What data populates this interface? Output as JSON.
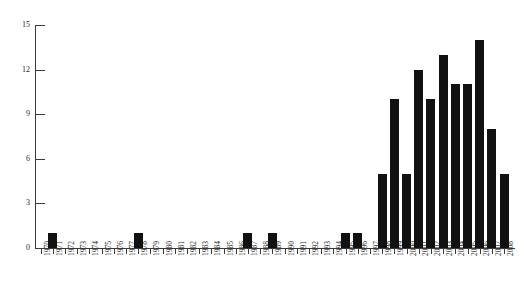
{
  "chart_data": {
    "type": "bar",
    "title": "",
    "subtitle": "",
    "xlabel": "",
    "ylabel": "",
    "grid": false,
    "legend": false,
    "legend_position": "none",
    "bar_color": "#111111",
    "axis_color": "#3a3a3a",
    "background_color": "#ffffff",
    "xlim_categories": [
      "1970",
      "2008"
    ],
    "ylim": [
      0,
      15
    ],
    "y_ticks": [
      0,
      3,
      6,
      9,
      12,
      15
    ],
    "y_tick_labels": [
      "0",
      "3",
      "6",
      "9",
      "12",
      "15"
    ],
    "categories": [
      "1970",
      "1971",
      "1972",
      "1973",
      "1974",
      "1975",
      "1976",
      "1977",
      "1978",
      "1979",
      "1980",
      "1981",
      "1982",
      "1983",
      "1984",
      "1985",
      "1986",
      "1987",
      "1988",
      "1989",
      "1990",
      "1991",
      "1992",
      "1993",
      "1994",
      "1995",
      "1996",
      "1997",
      "1998",
      "1999",
      "2000",
      "2001",
      "2002",
      "2003",
      "2004",
      "2005",
      "2006",
      "2007",
      "2008"
    ],
    "values": [
      0,
      1,
      0,
      0,
      0,
      0,
      0,
      0,
      1,
      0,
      0,
      0,
      0,
      0,
      0,
      0,
      0,
      1,
      0,
      1,
      0,
      0,
      0,
      0,
      0,
      1,
      1,
      0,
      5,
      10,
      5,
      12,
      10,
      13,
      11,
      11,
      14,
      8,
      5
    ]
  }
}
